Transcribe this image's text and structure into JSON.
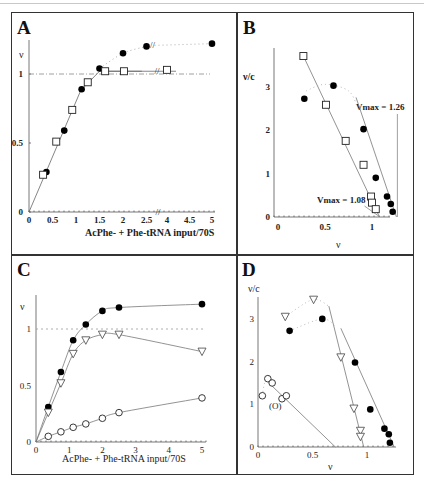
{
  "figure": {
    "panels": [
      {
        "id": "A",
        "label": "A"
      },
      {
        "id": "B",
        "label": "B"
      },
      {
        "id": "C",
        "label": "C"
      },
      {
        "id": "D",
        "label": "D"
      }
    ]
  },
  "chart_data": [
    {
      "panel": "A",
      "type": "scatter",
      "title": "",
      "xlabel": "AcPhe- + Phe-tRNA input/70S",
      "ylabel": "ν",
      "x_ticks": [
        "0",
        "0.5",
        "1",
        "1.5",
        "2",
        "2.5",
        "4",
        "4.5",
        "5"
      ],
      "y_ticks": [
        "0",
        "0.5",
        "1"
      ],
      "axis_break": "between 2.5 and 4 (//)",
      "reference_line": {
        "y": 1,
        "style": "dash-dot"
      },
      "series": [
        {
          "name": "filled circles",
          "marker": "filled-circle",
          "points": [
            [
              0.37,
              0.29
            ],
            [
              0.75,
              0.59
            ],
            [
              1.12,
              0.89
            ],
            [
              1.5,
              1.04
            ],
            [
              2.0,
              1.15
            ],
            [
              2.5,
              1.2
            ],
            [
              5.0,
              1.22
            ]
          ],
          "fit": "solid to 1.5, dotted beyond"
        },
        {
          "name": "open squares",
          "marker": "open-square",
          "points": [
            [
              0.3,
              0.27
            ],
            [
              0.58,
              0.51
            ],
            [
              0.92,
              0.74
            ],
            [
              1.25,
              0.94
            ],
            [
              1.62,
              1.02
            ],
            [
              2.02,
              1.02
            ],
            [
              4.0,
              1.03
            ]
          ],
          "fit": "solid"
        }
      ],
      "xlim": [
        0,
        5
      ],
      "ylim": [
        0,
        1.3
      ],
      "grid": false
    },
    {
      "panel": "B",
      "type": "scatter",
      "xlabel": "ν",
      "ylabel": "ν/c",
      "x_ticks": [
        "0",
        "0.5",
        "1"
      ],
      "y_ticks": [
        "0",
        "1",
        "2",
        "3"
      ],
      "annotations": [
        "Vmax = 1.26",
        "Vmax = 1.08"
      ],
      "series": [
        {
          "name": "open squares",
          "marker": "open-square",
          "points": [
            [
              0.27,
              3.7
            ],
            [
              0.51,
              2.58
            ],
            [
              0.72,
              1.75
            ],
            [
              0.91,
              1.2
            ],
            [
              0.99,
              0.47
            ],
            [
              1.0,
              0.33
            ],
            [
              1.04,
              0.18
            ]
          ],
          "fit": {
            "type": "line",
            "x_intercept": 1.08
          }
        },
        {
          "name": "filled circles",
          "marker": "filled-circle",
          "points": [
            [
              0.28,
              2.72
            ],
            [
              0.59,
              3.02
            ],
            [
              0.91,
              2.02
            ],
            [
              1.04,
              0.9
            ],
            [
              1.16,
              0.47
            ],
            [
              1.2,
              0.3
            ],
            [
              1.22,
              0.12
            ]
          ],
          "fit": {
            "type": "line",
            "x_intercept": 1.26
          }
        }
      ],
      "xlim": [
        0,
        1.3
      ],
      "ylim": [
        0,
        3.9
      ],
      "grid": false
    },
    {
      "panel": "C",
      "type": "line",
      "xlabel": "AcPhe- + Phe-tRNA input/70S",
      "ylabel": "ν",
      "x_ticks": [
        "0",
        "1",
        "2",
        "3",
        "4",
        "5"
      ],
      "y_ticks": [
        "0",
        "0.5",
        "1"
      ],
      "reference_line": {
        "y": 1,
        "style": "dotted"
      },
      "series": [
        {
          "name": "filled circles",
          "marker": "filled-circle",
          "points": [
            [
              0.37,
              0.31
            ],
            [
              0.75,
              0.62
            ],
            [
              1.12,
              0.9
            ],
            [
              1.5,
              1.04
            ],
            [
              2.0,
              1.16
            ],
            [
              2.5,
              1.19
            ],
            [
              5.0,
              1.22
            ]
          ]
        },
        {
          "name": "open triangles",
          "marker": "open-triangle-down",
          "points": [
            [
              0.37,
              0.26
            ],
            [
              0.75,
              0.52
            ],
            [
              1.12,
              0.78
            ],
            [
              1.5,
              0.9
            ],
            [
              2.0,
              0.95
            ],
            [
              2.5,
              0.95
            ],
            [
              5.0,
              0.8
            ]
          ]
        },
        {
          "name": "open circles",
          "marker": "open-circle",
          "points": [
            [
              0.37,
              0.05
            ],
            [
              0.75,
              0.09
            ],
            [
              1.12,
              0.13
            ],
            [
              1.5,
              0.16
            ],
            [
              2.0,
              0.21
            ],
            [
              2.5,
              0.26
            ],
            [
              5.0,
              0.39
            ]
          ]
        }
      ],
      "xlim": [
        0,
        5
      ],
      "ylim": [
        0,
        1.3
      ],
      "grid": false
    },
    {
      "panel": "D",
      "type": "scatter",
      "xlabel": "ν",
      "ylabel": "ν/c",
      "x_ticks": [
        "0",
        "0.5",
        "1"
      ],
      "y_ticks": [
        "0",
        "1",
        "2",
        "3"
      ],
      "annotations": [
        "(O)"
      ],
      "series": [
        {
          "name": "open triangles",
          "marker": "open-triangle-down",
          "points": [
            [
              0.25,
              3.05
            ],
            [
              0.51,
              3.45
            ],
            [
              0.76,
              2.1
            ],
            [
              0.88,
              0.9
            ],
            [
              0.94,
              0.38
            ],
            [
              0.94,
              0.24
            ]
          ],
          "fit": {
            "type": "line",
            "from": [
              0.65,
              3.3
            ],
            "to": [
              0.97,
              0
            ]
          }
        },
        {
          "name": "filled circles",
          "marker": "filled-circle",
          "points": [
            [
              0.29,
              2.72
            ],
            [
              0.59,
              3.0
            ],
            [
              0.89,
              1.98
            ],
            [
              1.03,
              0.88
            ],
            [
              1.16,
              0.43
            ],
            [
              1.2,
              0.3
            ],
            [
              1.21,
              0.1
            ]
          ],
          "fit": {
            "type": "line",
            "from": [
              0.76,
              2.78
            ],
            "to": [
              1.25,
              0
            ]
          }
        },
        {
          "name": "open circles",
          "marker": "open-circle",
          "points": [
            [
              0.04,
              1.2
            ],
            [
              0.09,
              1.6
            ],
            [
              0.13,
              1.5
            ],
            [
              0.22,
              1.13
            ],
            [
              0.26,
              1.2
            ],
            [
              0.15,
              0.93
            ]
          ],
          "fit": {
            "type": "line",
            "from": [
              0.1,
              1.5
            ],
            "to": [
              0.71,
              0
            ]
          }
        }
      ],
      "xlim": [
        0,
        1.3
      ],
      "ylim": [
        0,
        3.6
      ],
      "grid": false
    }
  ],
  "layout": {
    "A": {
      "x0": 29,
      "x1": 212,
      "y0": 212,
      "y1": 74,
      "ymax": 1.3,
      "brk": true
    },
    "B": {
      "x0": 278,
      "x1": 372,
      "y0": 217,
      "ysc": 43.5
    },
    "C": {
      "x0": 36,
      "xs": 33.2,
      "y0": 442,
      "y1": 329
    },
    "D": {
      "x0": 258,
      "x1": 367,
      "y0": 447,
      "ysc": 42.7
    }
  },
  "texts": {
    "A_ylabel": "ν",
    "B_ylabel": "ν/c",
    "C_ylabel": "ν",
    "D_ylabel": "ν/c",
    "A_xlabel": "AcPhe- + Phe-tRNA input/70S",
    "C_xlabel": "AcPhe- + Phe-tRNA input/70S",
    "B_xlabel": "ν",
    "D_xlabel": "ν",
    "B_vmax1": "Vmax = 1.26",
    "B_vmax2": "Vmax = 1.08",
    "D_paren": "(O)"
  }
}
